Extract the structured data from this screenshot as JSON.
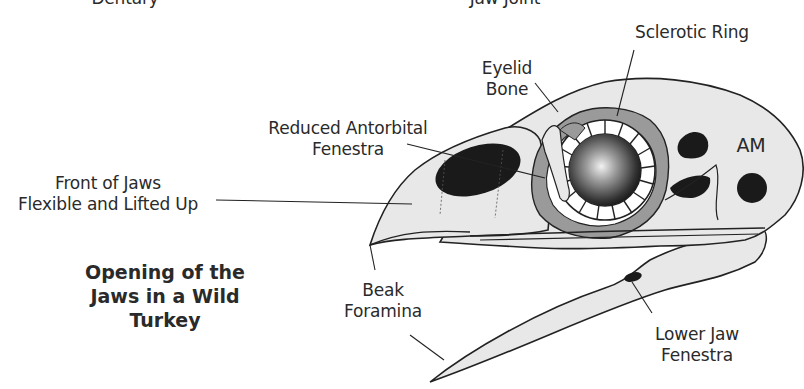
{
  "diagram": {
    "title_lines": [
      "Opening of the",
      "Jaws in a Wild",
      "Turkey"
    ],
    "labels": {
      "dentary": "Dentary",
      "jaw_joint": "Jaw Joint",
      "sclerotic_ring": "Sclerotic Ring",
      "eyelid_bone": [
        "Eyelid",
        "Bone"
      ],
      "reduced_antorbital_fenestra": [
        "Reduced Antorbital",
        "Fenestra"
      ],
      "front_of_jaws": [
        "Front of Jaws",
        "Flexible and Lifted Up"
      ],
      "am": "AM",
      "beak_foramina": [
        "Beak",
        "Foramina"
      ],
      "lower_jaw_fenestra": [
        "Lower Jaw",
        "Fenestra"
      ]
    },
    "colors": {
      "bone_fill": "#e8e8e8",
      "gray_fill": "#9a9a9a",
      "dark_fill": "#1a1a1a",
      "outline": "#222222",
      "text": "#2a2a2a"
    }
  }
}
